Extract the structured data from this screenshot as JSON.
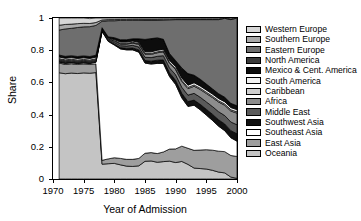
{
  "chart_data": {
    "type": "area",
    "title": "",
    "xlabel": "Year of Admission",
    "ylabel": "Share",
    "xlim": [
      1970,
      2000
    ],
    "ylim": [
      0,
      1
    ],
    "grid": false,
    "legend_position": "right",
    "stacked": true,
    "normalized": true,
    "xticks": [
      1970,
      1975,
      1980,
      1985,
      1990,
      1995,
      2000
    ],
    "yticks": [
      0,
      0.2,
      0.4,
      0.6,
      0.8,
      1
    ],
    "ytick_labels": [
      "0",
      "0.2",
      "0.4",
      "0.6",
      "0.8",
      "1"
    ],
    "xtick_labels": [
      "1970",
      "1975",
      "1980",
      "1985",
      "1990",
      "1995",
      "2000"
    ],
    "x": [
      1971,
      1972,
      1973,
      1974,
      1975,
      1976,
      1977,
      1978,
      1979,
      1980,
      1981,
      1982,
      1983,
      1984,
      1985,
      1986,
      1987,
      1988,
      1989,
      1990,
      1991,
      1992,
      1993,
      1994,
      1995,
      1996,
      1997,
      1998,
      1999,
      2000
    ],
    "series": [
      {
        "name": "Western Europe",
        "color": "#d6d6d6",
        "values": [
          0.045,
          0.04,
          0.038,
          0.035,
          0.033,
          0.03,
          0.028,
          0.012,
          0.01,
          0.01,
          0.009,
          0.009,
          0.008,
          0.008,
          0.008,
          0.008,
          0.008,
          0.007,
          0.007,
          0.006,
          0.006,
          0.006,
          0.006,
          0.006,
          0.006,
          0.006,
          0.006,
          0.006,
          0.006,
          0.006
        ]
      },
      {
        "name": "Southern Europe",
        "color": "#a9a9a9",
        "values": [
          0.03,
          0.028,
          0.026,
          0.024,
          0.022,
          0.02,
          0.018,
          0.008,
          0.007,
          0.007,
          0.006,
          0.006,
          0.006,
          0.005,
          0.005,
          0.005,
          0.005,
          0.005,
          0.004,
          0.004,
          0.004,
          0.004,
          0.004,
          0.004,
          0.004,
          0.004,
          0.004,
          0.004,
          0.004,
          0.004
        ]
      },
      {
        "name": "Eastern Europe",
        "color": "#6e6e6e",
        "values": [
          0.155,
          0.17,
          0.17,
          0.18,
          0.18,
          0.185,
          0.185,
          0.04,
          0.1,
          0.105,
          0.12,
          0.12,
          0.115,
          0.115,
          0.12,
          0.115,
          0.11,
          0.12,
          0.21,
          0.255,
          0.3,
          0.335,
          0.345,
          0.37,
          0.4,
          0.43,
          0.46,
          0.49,
          0.52,
          0.545
        ]
      },
      {
        "name": "North America",
        "color": "#3a3a3a",
        "values": [
          0.004,
          0.004,
          0.004,
          0.004,
          0.004,
          0.004,
          0.004,
          0.002,
          0.002,
          0.002,
          0.002,
          0.002,
          0.002,
          0.002,
          0.002,
          0.002,
          0.002,
          0.002,
          0.002,
          0.002,
          0.002,
          0.002,
          0.002,
          0.002,
          0.002,
          0.002,
          0.002,
          0.002,
          0.002,
          0.002
        ]
      },
      {
        "name": "Mexico & Cent. America",
        "color": "#0d0d0d",
        "values": [
          0.008,
          0.008,
          0.008,
          0.008,
          0.008,
          0.008,
          0.008,
          0.004,
          0.004,
          0.01,
          0.012,
          0.012,
          0.012,
          0.02,
          0.075,
          0.08,
          0.075,
          0.06,
          0.04,
          0.035,
          0.06,
          0.07,
          0.045,
          0.04,
          0.035,
          0.03,
          0.028,
          0.026,
          0.024,
          0.022
        ]
      },
      {
        "name": "South America",
        "color": "#f2f2f2",
        "values": [
          0.01,
          0.01,
          0.01,
          0.01,
          0.01,
          0.01,
          0.01,
          0.004,
          0.004,
          0.006,
          0.008,
          0.008,
          0.008,
          0.008,
          0.01,
          0.01,
          0.01,
          0.01,
          0.012,
          0.012,
          0.014,
          0.014,
          0.014,
          0.014,
          0.014,
          0.014,
          0.014,
          0.014,
          0.014,
          0.014
        ]
      },
      {
        "name": "Caribbean",
        "color": "#cfcfcf",
        "values": [
          0.006,
          0.006,
          0.006,
          0.006,
          0.006,
          0.006,
          0.006,
          0.003,
          0.003,
          0.004,
          0.005,
          0.005,
          0.005,
          0.005,
          0.006,
          0.006,
          0.006,
          0.006,
          0.007,
          0.007,
          0.008,
          0.008,
          0.008,
          0.008,
          0.008,
          0.008,
          0.008,
          0.008,
          0.008,
          0.008
        ]
      },
      {
        "name": "Africa",
        "color": "#8c8c8c",
        "values": [
          0.006,
          0.006,
          0.006,
          0.006,
          0.006,
          0.006,
          0.006,
          0.004,
          0.005,
          0.008,
          0.01,
          0.012,
          0.014,
          0.016,
          0.018,
          0.02,
          0.022,
          0.024,
          0.028,
          0.032,
          0.036,
          0.04,
          0.044,
          0.048,
          0.052,
          0.056,
          0.06,
          0.064,
          0.068,
          0.072
        ]
      },
      {
        "name": "Middle East",
        "color": "#5a5a5a",
        "values": [
          0.006,
          0.006,
          0.006,
          0.006,
          0.006,
          0.006,
          0.006,
          0.004,
          0.006,
          0.01,
          0.012,
          0.014,
          0.016,
          0.018,
          0.02,
          0.022,
          0.024,
          0.026,
          0.03,
          0.034,
          0.038,
          0.04,
          0.042,
          0.044,
          0.046,
          0.048,
          0.05,
          0.052,
          0.054,
          0.056
        ]
      },
      {
        "name": "Southwest Asia",
        "color": "#111111",
        "values": [
          0.004,
          0.004,
          0.004,
          0.004,
          0.004,
          0.004,
          0.004,
          0.003,
          0.004,
          0.006,
          0.008,
          0.01,
          0.012,
          0.014,
          0.016,
          0.018,
          0.02,
          0.022,
          0.024,
          0.026,
          0.028,
          0.03,
          0.032,
          0.034,
          0.036,
          0.038,
          0.04,
          0.042,
          0.044,
          0.046
        ]
      },
      {
        "name": "Southeast Asia",
        "color": "#ffffff",
        "values": [
          0.006,
          0.006,
          0.006,
          0.006,
          0.006,
          0.006,
          0.01,
          0.8,
          0.73,
          0.7,
          0.68,
          0.68,
          0.68,
          0.66,
          0.56,
          0.55,
          0.56,
          0.55,
          0.45,
          0.4,
          0.3,
          0.26,
          0.28,
          0.25,
          0.215,
          0.185,
          0.155,
          0.13,
          0.11,
          0.095
        ]
      },
      {
        "name": "East Asia",
        "color": "#9e9e9e",
        "values": [
          0.06,
          0.058,
          0.058,
          0.056,
          0.056,
          0.054,
          0.054,
          0.024,
          0.03,
          0.035,
          0.04,
          0.042,
          0.044,
          0.046,
          0.05,
          0.052,
          0.054,
          0.06,
          0.075,
          0.085,
          0.095,
          0.1,
          0.11,
          0.115,
          0.12,
          0.125,
          0.13,
          0.132,
          0.134,
          0.136
        ]
      },
      {
        "name": "Oceania",
        "color": "#c4c4c4",
        "values": [
          0.66,
          0.654,
          0.658,
          0.655,
          0.659,
          0.657,
          0.661,
          0.092,
          0.095,
          0.097,
          0.088,
          0.08,
          0.078,
          0.082,
          0.11,
          0.112,
          0.104,
          0.108,
          0.111,
          0.102,
          0.109,
          0.091,
          0.068,
          0.065,
          0.062,
          0.054,
          0.043,
          0.038,
          0.012,
          0.004
        ]
      }
    ],
    "legend_entries": [
      {
        "label": "Western Europe",
        "color": "#d6d6d6"
      },
      {
        "label": "Southern Europe",
        "color": "#a9a9a9"
      },
      {
        "label": "Eastern Europe",
        "color": "#6e6e6e"
      },
      {
        "label": "North America",
        "color": "#3a3a3a"
      },
      {
        "label": "Mexico & Cent. America",
        "color": "#0d0d0d"
      },
      {
        "label": "South America",
        "color": "#f2f2f2"
      },
      {
        "label": "Caribbean",
        "color": "#cfcfcf"
      },
      {
        "label": "Africa",
        "color": "#8c8c8c"
      },
      {
        "label": "Middle East",
        "color": "#5a5a5a"
      },
      {
        "label": "Southwest Asia",
        "color": "#111111"
      },
      {
        "label": "Southeast Asia",
        "color": "#ffffff"
      },
      {
        "label": "East Asia",
        "color": "#9e9e9e"
      },
      {
        "label": "Oceania",
        "color": "#c4c4c4"
      }
    ]
  }
}
